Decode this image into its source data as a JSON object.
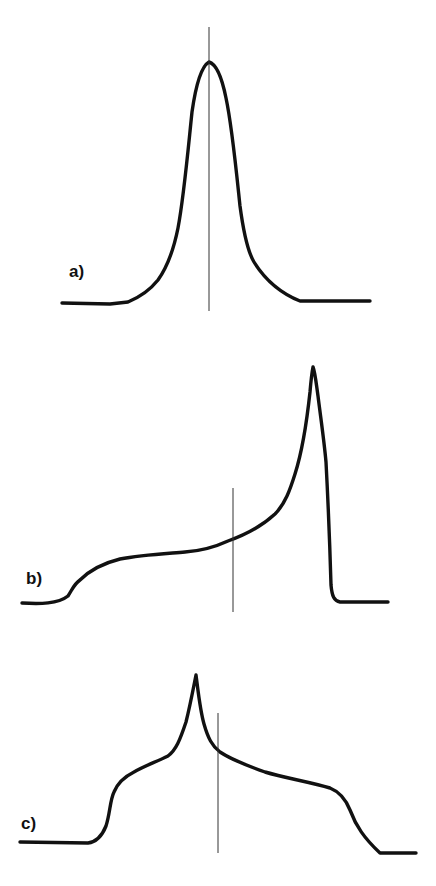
{
  "figure": {
    "panels": [
      {
        "id": "a",
        "label": "a)",
        "description": "Symmetric single peak centered on the vertical reference line",
        "reference_line": {
          "x": 209,
          "y1": 27,
          "y2": 311
        },
        "peak": {
          "x": 209,
          "y": 62
        }
      },
      {
        "id": "b",
        "label": "b)",
        "description": "Asymmetric lineshape with low-field shoulder and sharp high-field peak; reference line left of peak",
        "reference_line": {
          "x": 233,
          "y1": 488,
          "y2": 612
        },
        "peak": {
          "x": 313,
          "y": 367
        }
      },
      {
        "id": "c",
        "label": "c)",
        "description": "Broad lineshape with shoulders on both sides and a sharp central cusp; reference line right of cusp",
        "reference_line": {
          "x": 218,
          "y1": 713,
          "y2": 853
        },
        "peak": {
          "x": 196,
          "y": 675
        }
      }
    ],
    "colors": {
      "curve": "#111111",
      "reference_line": "#333333",
      "background": "#ffffff"
    }
  }
}
